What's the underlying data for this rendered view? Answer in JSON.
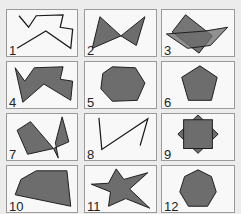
{
  "colors": {
    "background": "#ececec",
    "cell_background": "#f8f8f8",
    "cell_border": "#9a9a9a",
    "shape_fill": "#6d6d6d",
    "shape_stroke": "#1a1a1a"
  },
  "cells": [
    {
      "label": "1",
      "shape": "open-polyline-wandering",
      "filled": false
    },
    {
      "label": "2",
      "shape": "bowtie-self-intersecting",
      "filled": true
    },
    {
      "label": "3",
      "shape": "overlapping-parallelograms",
      "filled": true
    },
    {
      "label": "4",
      "shape": "irregular-concave-polygon",
      "filled": true
    },
    {
      "label": "5",
      "shape": "heptagon-irregular",
      "filled": true
    },
    {
      "label": "6",
      "shape": "regular-pentagon",
      "filled": true
    },
    {
      "label": "7",
      "shape": "self-intersecting-polygon",
      "filled": true
    },
    {
      "label": "8",
      "shape": "open-polyline-zigzag",
      "filled": false
    },
    {
      "label": "9",
      "shape": "square-over-rotated-square",
      "filled": true
    },
    {
      "label": "10",
      "shape": "convex-pentagon-irregular",
      "filled": true
    },
    {
      "label": "11",
      "shape": "irregular-star",
      "filled": true
    },
    {
      "label": "12",
      "shape": "regular-heptagon",
      "filled": true
    }
  ]
}
